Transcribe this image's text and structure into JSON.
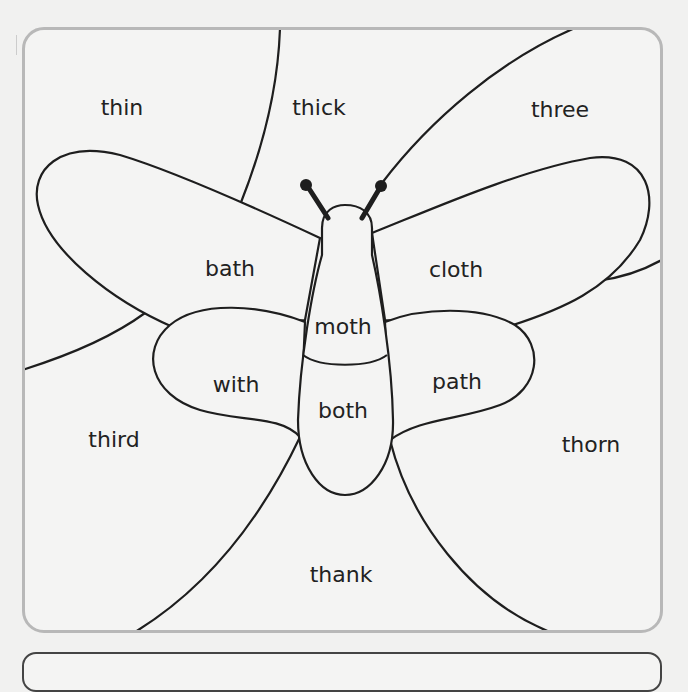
{
  "worksheet": {
    "title": "Butterfly 'th' word colouring puzzle",
    "regions": [
      {
        "id": "thin",
        "label": "thin",
        "x": 122,
        "y": 107
      },
      {
        "id": "thick",
        "label": "thick",
        "x": 319,
        "y": 107
      },
      {
        "id": "three",
        "label": "three",
        "x": 560,
        "y": 109
      },
      {
        "id": "bath",
        "label": "bath",
        "x": 230,
        "y": 268
      },
      {
        "id": "cloth",
        "label": "cloth",
        "x": 456,
        "y": 269
      },
      {
        "id": "moth",
        "label": "moth",
        "x": 343,
        "y": 326
      },
      {
        "id": "with",
        "label": "with",
        "x": 236,
        "y": 384
      },
      {
        "id": "path",
        "label": "path",
        "x": 457,
        "y": 381
      },
      {
        "id": "both",
        "label": "both",
        "x": 343,
        "y": 410
      },
      {
        "id": "third",
        "label": "third",
        "x": 114,
        "y": 439
      },
      {
        "id": "thorn",
        "label": "thorn",
        "x": 591,
        "y": 444
      },
      {
        "id": "thank",
        "label": "thank",
        "x": 341,
        "y": 574
      }
    ],
    "colors": {
      "frame_border": "#b8b8b8",
      "line": "#1e1e1e",
      "background": "#f4f4f3"
    }
  },
  "instruction_box": {
    "text": ""
  }
}
